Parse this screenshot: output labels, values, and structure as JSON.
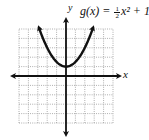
{
  "chart_data": {
    "type": "line",
    "function": {
      "name": "g(x)",
      "expression": "1/2 x^2 + 1",
      "a": 0.5,
      "b": 0,
      "c": 1
    },
    "xlabel": "x",
    "ylabel": "y",
    "xlim": [
      -5,
      5
    ],
    "ylim": [
      -5,
      5
    ],
    "grid": true,
    "grid_style": "dotted",
    "vertex": [
      0,
      1
    ],
    "series": [
      {
        "name": "g(x)",
        "x": [
          -2.9,
          -2,
          -1,
          0,
          1,
          2,
          2.9
        ],
        "values": [
          5.2,
          3,
          1.5,
          1,
          1.5,
          3,
          5.2
        ]
      }
    ],
    "arrows": {
      "axes": true,
      "curve_ends": true
    },
    "legend": "none"
  },
  "labels": {
    "function_name": "g(x) = ",
    "frac_num": "1",
    "frac_den": "2",
    "function_rest": "x² + 1",
    "x_axis": "x",
    "y_axis": "y"
  },
  "colors": {
    "axis": "#111111",
    "curve": "#111111",
    "grid": "#9a9a9a",
    "background": "#ffffff"
  }
}
